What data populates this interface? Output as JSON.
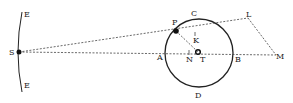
{
  "diagram": {
    "type": "geometric-astronomy-figure",
    "labels": {
      "E_top": "E",
      "E_bottom": "E",
      "S": "S",
      "P": "P",
      "C": "C",
      "K": "K",
      "L": "L",
      "A": "A",
      "N": "N",
      "T": "T",
      "B": "B",
      "M": "M",
      "D": "D"
    },
    "points": {
      "S": [
        19,
        52
      ],
      "P": [
        176,
        31
      ],
      "T": [
        198,
        52
      ],
      "N": [
        189,
        52
      ],
      "K": [
        195,
        36
      ],
      "L": [
        248,
        18
      ],
      "M": [
        276,
        55
      ],
      "A": [
        166,
        52
      ],
      "B": [
        232,
        52
      ]
    },
    "circle": {
      "center": [
        199,
        53
      ],
      "radius": 34
    },
    "colors": {
      "line": "#222222",
      "background": "#ffffff"
    }
  }
}
